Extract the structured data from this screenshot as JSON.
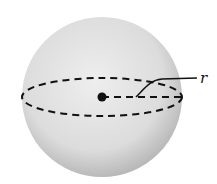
{
  "diagram": {
    "labels": {
      "radius": "r"
    },
    "colors": {
      "sphere_light": "#ececec",
      "sphere_dark": "#b8b8b8",
      "ink": "#111111"
    }
  }
}
